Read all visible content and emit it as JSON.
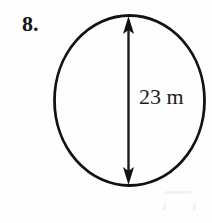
{
  "figure": {
    "problem_number": "8.",
    "shape": "circle",
    "dimension_label": "23 m",
    "dimension_type": "diameter",
    "measurement_value": 23,
    "measurement_unit": "m",
    "stroke_color": "#111111",
    "background_color": "#fefefe",
    "text_color": "#151515"
  },
  "geometry": {
    "circle_center_x": 129,
    "circle_center_y": 100,
    "circle_radius_x": 75,
    "circle_radius_y": 85,
    "arrow_x": 128,
    "arrow_top_y": 17,
    "arrow_bottom_y": 184
  }
}
